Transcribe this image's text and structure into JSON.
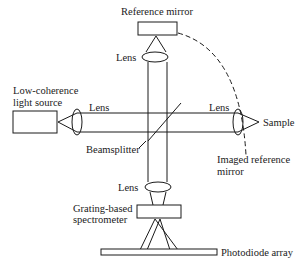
{
  "diagram": {
    "labels": {
      "reference_mirror": "Reference mirror",
      "lens_top": "Lens",
      "light_source_line1": "Low-coherence",
      "light_source_line2": "light source",
      "lens_left": "Lens",
      "lens_right": "Lens",
      "sample": "Sample",
      "beamsplitter": "Beamsplitter",
      "imaged_ref_line1": "Imaged reference",
      "imaged_ref_line2": "mirror",
      "lens_bottom": "Lens",
      "spectrometer_line1": "Grating-based",
      "spectrometer_line2": "spectrometer",
      "photodiode_array": "Photodiode array"
    },
    "components": [
      "reference-mirror",
      "lens-top",
      "low-coherence-light-source",
      "lens-left",
      "beamsplitter",
      "lens-right",
      "sample",
      "imaged-reference-mirror",
      "lens-bottom",
      "grating-based-spectrometer",
      "photodiode-array"
    ],
    "colors": {
      "line": "#1a1a1a",
      "background": "#ffffff"
    }
  }
}
